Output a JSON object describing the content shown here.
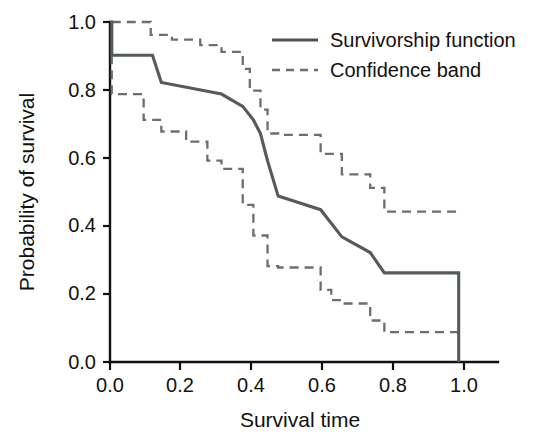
{
  "chart_data": {
    "type": "line",
    "subtype": "kaplan-meier-step",
    "title": "",
    "xlabel": "Survival time",
    "ylabel": "Probability of survival",
    "xlim": [
      0.0,
      1.05
    ],
    "ylim": [
      0.0,
      1.0
    ],
    "xticks": [
      0.0,
      0.2,
      0.4,
      0.6,
      0.8,
      1.0
    ],
    "xticklabels": [
      "0.0",
      "0.2",
      "0.4",
      "0.6",
      "0.8",
      "1.0"
    ],
    "yticks": [
      0.0,
      0.2,
      0.4,
      0.6,
      0.8,
      1.0
    ],
    "yticklabels": [
      "0.0",
      "0.2",
      "0.4",
      "0.6",
      "0.8",
      "1.0"
    ],
    "grid": false,
    "legend_position": "top-right",
    "colors": {
      "survivorship": "#555a5c",
      "confidence": "#6a6f71",
      "axis": "#111111",
      "background": "#ffffff"
    },
    "series": [
      {
        "name": "Survivorship function",
        "style": "solid",
        "x": [
          0.0,
          0.005,
          0.005,
          0.12,
          0.12,
          0.145,
          0.145,
          0.315,
          0.315,
          0.375,
          0.375,
          0.405,
          0.405,
          0.425,
          0.425,
          0.445,
          0.445,
          0.475,
          0.475,
          0.595,
          0.595,
          0.625,
          0.625,
          0.655,
          0.655,
          0.735,
          0.735,
          0.775,
          0.775,
          0.985,
          0.985
        ],
        "y": [
          1.0,
          1.0,
          0.902,
          0.902,
          0.902,
          0.822,
          0.822,
          0.788,
          0.788,
          0.752,
          0.752,
          0.712,
          0.712,
          0.672,
          0.672,
          0.592,
          0.592,
          0.488,
          0.488,
          0.448,
          0.448,
          0.408,
          0.408,
          0.368,
          0.368,
          0.322,
          0.322,
          0.262,
          0.262,
          0.262,
          0.0
        ],
        "steps": [
          {
            "time": 0.0,
            "survival": 1.0
          },
          {
            "time": 0.005,
            "survival": 0.902
          },
          {
            "time": 0.12,
            "survival": 0.902
          },
          {
            "time": 0.145,
            "survival": 0.822
          },
          {
            "time": 0.315,
            "survival": 0.788
          },
          {
            "time": 0.375,
            "survival": 0.752
          },
          {
            "time": 0.405,
            "survival": 0.712
          },
          {
            "time": 0.425,
            "survival": 0.672
          },
          {
            "time": 0.445,
            "survival": 0.592
          },
          {
            "time": 0.475,
            "survival": 0.488
          },
          {
            "time": 0.595,
            "survival": 0.448
          },
          {
            "time": 0.625,
            "survival": 0.408
          },
          {
            "time": 0.655,
            "survival": 0.368
          },
          {
            "time": 0.735,
            "survival": 0.322
          },
          {
            "time": 0.775,
            "survival": 0.262
          },
          {
            "time": 0.985,
            "survival": 0.262
          },
          {
            "time": 0.985,
            "survival": 0.0
          }
        ]
      },
      {
        "name": "Confidence band upper",
        "style": "dashed",
        "legend_group": "Confidence band",
        "x": [
          0.005,
          0.005,
          0.115,
          0.115,
          0.175,
          0.175,
          0.255,
          0.255,
          0.315,
          0.315,
          0.375,
          0.375,
          0.395,
          0.395,
          0.425,
          0.425,
          0.445,
          0.445,
          0.475,
          0.475,
          0.595,
          0.595,
          0.655,
          0.655,
          0.735,
          0.735,
          0.775,
          0.775,
          0.985,
          0.985
        ],
        "y": [
          1.0,
          1.0,
          1.0,
          0.962,
          0.962,
          0.948,
          0.948,
          0.932,
          0.932,
          0.912,
          0.912,
          0.862,
          0.862,
          0.798,
          0.798,
          0.742,
          0.742,
          0.672,
          0.672,
          0.668,
          0.668,
          0.612,
          0.612,
          0.552,
          0.552,
          0.512,
          0.512,
          0.442,
          0.442,
          0.442
        ]
      },
      {
        "name": "Confidence band lower",
        "style": "dashed",
        "legend_group": "Confidence band",
        "x": [
          0.005,
          0.005,
          0.015,
          0.015,
          0.095,
          0.095,
          0.145,
          0.145,
          0.215,
          0.215,
          0.275,
          0.275,
          0.315,
          0.315,
          0.375,
          0.375,
          0.405,
          0.405,
          0.445,
          0.445,
          0.475,
          0.475,
          0.595,
          0.595,
          0.625,
          0.625,
          0.655,
          0.655,
          0.735,
          0.735,
          0.775,
          0.775,
          0.985
        ],
        "y": [
          0.902,
          0.788,
          0.788,
          0.788,
          0.788,
          0.712,
          0.712,
          0.678,
          0.678,
          0.648,
          0.648,
          0.592,
          0.592,
          0.568,
          0.568,
          0.462,
          0.462,
          0.372,
          0.372,
          0.282,
          0.282,
          0.278,
          0.278,
          0.212,
          0.212,
          0.182,
          0.182,
          0.172,
          0.172,
          0.122,
          0.122,
          0.088,
          0.088
        ]
      }
    ],
    "legend": [
      {
        "label": "Survivorship function",
        "style": "solid"
      },
      {
        "label": "Confidence band",
        "style": "dashed"
      }
    ]
  },
  "legend": {
    "items": [
      {
        "label": "Survivorship function"
      },
      {
        "label": "Confidence band"
      }
    ]
  },
  "axes": {
    "x_title": "Survival time",
    "y_title": "Probability of survival",
    "x_ticks": [
      "0.0",
      "0.2",
      "0.4",
      "0.6",
      "0.8",
      "1.0"
    ],
    "y_ticks": [
      "0.0",
      "0.2",
      "0.4",
      "0.6",
      "0.8",
      "1.0"
    ]
  }
}
